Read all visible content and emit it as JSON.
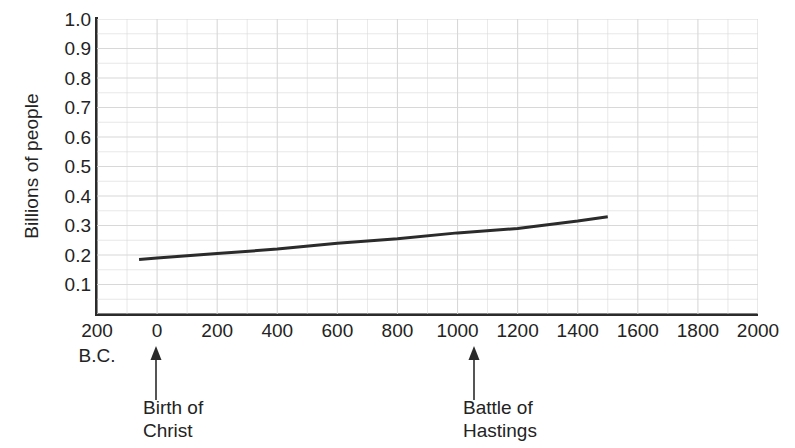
{
  "chart_data": {
    "type": "line",
    "title": "",
    "xlabel": "",
    "ylabel": "Billions of people",
    "xlim": [
      -200,
      2000
    ],
    "ylim": [
      0,
      1.0
    ],
    "grid": true,
    "legend": false,
    "x_tick_labels": [
      "200",
      "0",
      "200",
      "400",
      "600",
      "800",
      "1000",
      "1200",
      "1400",
      "1600",
      "1800",
      "2000"
    ],
    "x_tick_values": [
      -200,
      0,
      200,
      400,
      600,
      800,
      1000,
      1200,
      1400,
      1600,
      1800,
      2000
    ],
    "x_axis_era_note": "B.C.",
    "y_tick_labels": [
      "1.0",
      "0.9",
      "0.8",
      "0.7",
      "0.6",
      "0.5",
      "0.4",
      "0.3",
      "0.2",
      "0.1"
    ],
    "y_tick_values": [
      1.0,
      0.9,
      0.8,
      0.7,
      0.6,
      0.5,
      0.4,
      0.3,
      0.2,
      0.1
    ],
    "minor_grid_step_x": 100,
    "minor_grid_step_y": 0.05,
    "series": [
      {
        "name": "World population",
        "color": "#2b2b2b",
        "x": [
          -60,
          0,
          200,
          400,
          600,
          800,
          1000,
          1200,
          1400,
          1500
        ],
        "y": [
          0.185,
          0.19,
          0.205,
          0.22,
          0.24,
          0.255,
          0.275,
          0.29,
          0.315,
          0.33
        ]
      }
    ],
    "annotations": [
      {
        "label_line1": "Birth of",
        "label_line2": "Christ",
        "x_value": 0
      },
      {
        "label_line1": "Battle of",
        "label_line2": "Hastings",
        "x_value": 1066
      }
    ]
  },
  "axis": {
    "y_title": "Billions of people",
    "y_ticks": [
      "1.0",
      "0.9",
      "0.8",
      "0.7",
      "0.6",
      "0.5",
      "0.4",
      "0.3",
      "0.2",
      "0.1"
    ],
    "x_ticks": [
      "200",
      "0",
      "200",
      "400",
      "600",
      "800",
      "1000",
      "1200",
      "1400",
      "1600",
      "1800",
      "2000"
    ],
    "bc_note": "B.C."
  },
  "annotations": {
    "birth": {
      "line1": "Birth of",
      "line2": "Christ"
    },
    "hastings": {
      "line1": "Battle of",
      "line2": "Hastings"
    }
  },
  "colors": {
    "line": "#2b2b2b",
    "axis": "#2b2b2b",
    "grid": "#d8d8d8",
    "text": "#232323",
    "background": "#ffffff"
  }
}
